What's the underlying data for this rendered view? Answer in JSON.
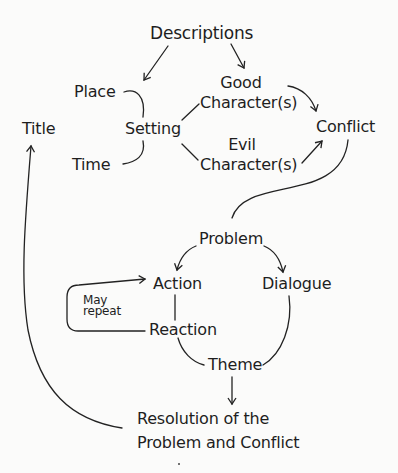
{
  "diagram": {
    "type": "story-structure-flow",
    "nodes": {
      "descriptions": "Descriptions",
      "place": "Place",
      "setting": "Setting",
      "time": "Time",
      "title": "Title",
      "good_character_line1": "Good",
      "good_character_line2": "Character(s)",
      "evil_character_line1": "Evil",
      "evil_character_line2": "Character(s)",
      "conflict": "Conflict",
      "problem": "Problem",
      "action": "Action",
      "dialogue": "Dialogue",
      "reaction": "Reaction",
      "may_repeat_line1": "May",
      "may_repeat_line2": "repeat",
      "theme": "Theme",
      "resolution_line1": "Resolution of the",
      "resolution_line2": "Problem and Conflict"
    },
    "edges": [
      {
        "from": "Descriptions",
        "to": "Setting",
        "arrow": true
      },
      {
        "from": "Descriptions",
        "to": "Good Character(s)",
        "arrow": true
      },
      {
        "from": "Place",
        "to": "Setting",
        "arrow": false
      },
      {
        "from": "Time",
        "to": "Setting",
        "arrow": false
      },
      {
        "from": "Setting",
        "to": "Good Character(s)",
        "arrow": false
      },
      {
        "from": "Setting",
        "to": "Evil Character(s)",
        "arrow": false
      },
      {
        "from": "Good Character(s)",
        "to": "Conflict",
        "arrow": true
      },
      {
        "from": "Evil Character(s)",
        "to": "Conflict",
        "arrow": true
      },
      {
        "from": "Conflict",
        "to": "Problem",
        "arrow": false
      },
      {
        "from": "Problem",
        "to": "Action",
        "arrow": true
      },
      {
        "from": "Problem",
        "to": "Dialogue",
        "arrow": true
      },
      {
        "from": "Action",
        "to": "Reaction",
        "arrow": false
      },
      {
        "from": "Reaction",
        "to": "Action",
        "arrow": true,
        "label": "May repeat"
      },
      {
        "from": "Reaction",
        "to": "Theme",
        "arrow": false
      },
      {
        "from": "Dialogue",
        "to": "Theme",
        "arrow": false
      },
      {
        "from": "Theme",
        "to": "Resolution of the Problem and Conflict",
        "arrow": true
      },
      {
        "from": "Resolution of the Problem and Conflict",
        "to": "Title",
        "arrow": true
      }
    ],
    "colors": {
      "ink": "#1e1e1e",
      "paper": "#fbfbfa"
    }
  }
}
